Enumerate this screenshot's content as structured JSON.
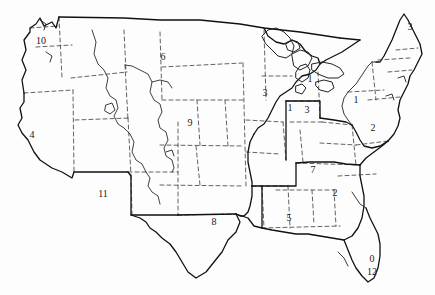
{
  "figure": {
    "kind": "map",
    "background_color": "#fdfdfd",
    "ink_color": "#1a1a1a",
    "state_border_style": "dashed",
    "region_border_style": "solid"
  },
  "map_data": {
    "type": "choropleth-outline",
    "projection": "conic",
    "label_count": 18,
    "label_values": [
      "10",
      "6",
      "3",
      "3",
      "1",
      "1",
      "3",
      "1",
      "2",
      "4",
      "9",
      "2",
      "7",
      "11",
      "8",
      "5",
      "0",
      "12"
    ],
    "legend": [],
    "labels": [
      {
        "id": "label-pacific-northwest",
        "text": "10",
        "x": 41,
        "y": 41
      },
      {
        "id": "label-northern-plains",
        "text": "6",
        "x": 163,
        "y": 57
      },
      {
        "id": "label-new-england",
        "text": "3",
        "x": 410,
        "y": 27
      },
      {
        "id": "label-upper-midwest",
        "text": "3",
        "x": 265,
        "y": 93
      },
      {
        "id": "label-great-lakes-north",
        "text": "1",
        "x": 310,
        "y": 79
      },
      {
        "id": "label-great-lakes-west",
        "text": "1",
        "x": 290,
        "y": 108
      },
      {
        "id": "label-ohio-valley",
        "text": "3",
        "x": 307,
        "y": 110
      },
      {
        "id": "label-mid-atlantic-north",
        "text": "1",
        "x": 356,
        "y": 100
      },
      {
        "id": "label-mid-atlantic",
        "text": "2",
        "x": 373,
        "y": 128
      },
      {
        "id": "label-california",
        "text": "4",
        "x": 32,
        "y": 135
      },
      {
        "id": "label-central-plains",
        "text": "9",
        "x": 190,
        "y": 123
      },
      {
        "id": "label-southeast-atlantic",
        "text": "2",
        "x": 335,
        "y": 193
      },
      {
        "id": "label-appalachia",
        "text": "7",
        "x": 313,
        "y": 170
      },
      {
        "id": "label-southwest",
        "text": "11",
        "x": 103,
        "y": 194
      },
      {
        "id": "label-texas",
        "text": "8",
        "x": 214,
        "y": 222
      },
      {
        "id": "label-deep-south",
        "text": "5",
        "x": 289,
        "y": 218
      },
      {
        "id": "label-florida-upper",
        "text": "0",
        "x": 372,
        "y": 259
      },
      {
        "id": "label-florida-lower",
        "text": "12",
        "x": 372,
        "y": 272
      }
    ]
  }
}
